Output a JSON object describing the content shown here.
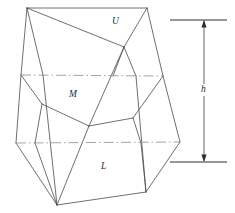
{
  "figure": {
    "type": "line-diagram",
    "width": 235,
    "height": 213,
    "background_color": "#ffffff",
    "solid_edge_color": "#4a4a4a",
    "dashed_edge_color": "#9a9a9a",
    "dimension_color": "#2f2f2f"
  },
  "labels": {
    "upper_zone": "U",
    "middle_zone": "M",
    "lower_zone": "L",
    "height_dimension": "h"
  },
  "label_positions": {
    "upper_zone": {
      "x": 112,
      "y": 17
    },
    "middle_zone": {
      "x": 69,
      "y": 90
    },
    "lower_zone": {
      "x": 101,
      "y": 162
    },
    "height_dimension": {
      "x": 203,
      "y": 89
    }
  },
  "geometry": {
    "top_face": [
      [
        27,
        8
      ],
      [
        147,
        8
      ],
      [
        124,
        47
      ]
    ],
    "upper_zone_edges": [
      [
        [
          27,
          8
        ],
        [
          124,
          47
        ]
      ],
      [
        [
          27,
          8
        ],
        [
          21,
          75
        ]
      ],
      [
        [
          27,
          8
        ],
        [
          43,
          75
        ]
      ],
      [
        [
          147,
          8
        ],
        [
          124,
          47
        ]
      ],
      [
        [
          147,
          8
        ],
        [
          163,
          76
        ]
      ],
      [
        [
          124,
          47
        ],
        [
          113,
          76
        ]
      ],
      [
        [
          124,
          47
        ],
        [
          136,
          76
        ]
      ],
      [
        [
          124,
          47
        ],
        [
          89,
          126
        ]
      ],
      [
        [
          43,
          75
        ],
        [
          57,
          205
        ]
      ]
    ],
    "upper_section_line": [
      [
        21,
        75
      ],
      [
        163,
        76
      ]
    ],
    "middle_zone_edges": [
      [
        [
          21,
          75
        ],
        [
          16,
          143
        ]
      ],
      [
        [
          21,
          75
        ],
        [
          42,
          104
        ]
      ],
      [
        [
          42,
          104
        ],
        [
          89,
          126
        ]
      ],
      [
        [
          89,
          126
        ],
        [
          133,
          118
        ]
      ],
      [
        [
          133,
          118
        ],
        [
          163,
          76
        ]
      ],
      [
        [
          163,
          76
        ],
        [
          180,
          142
        ]
      ],
      [
        [
          42,
          104
        ],
        [
          35,
          143
        ]
      ],
      [
        [
          133,
          118
        ],
        [
          141,
          143
        ]
      ]
    ],
    "lower_section_line": [
      [
        16,
        143
      ],
      [
        180,
        142
      ]
    ],
    "lower_zone_edges": [
      [
        [
          16,
          143
        ],
        [
          57,
          205
        ]
      ],
      [
        [
          57,
          205
        ],
        [
          146,
          192
        ]
      ],
      [
        [
          146,
          192
        ],
        [
          180,
          142
        ]
      ],
      [
        [
          57,
          205
        ],
        [
          89,
          126
        ]
      ],
      [
        [
          146,
          192
        ],
        [
          136,
          76
        ]
      ],
      [
        [
          57,
          205
        ],
        [
          35,
          143
        ]
      ],
      [
        [
          146,
          192
        ],
        [
          141,
          143
        ]
      ]
    ]
  },
  "dimension": {
    "label": "h",
    "top_extension_line": [
      [
        170,
        20
      ],
      [
        227,
        20
      ]
    ],
    "bottom_extension_line": [
      [
        170,
        162
      ],
      [
        227,
        162
      ]
    ],
    "arrow_line": [
      [
        204,
        20
      ],
      [
        204,
        162
      ]
    ],
    "arrow_style": "double-headed"
  }
}
